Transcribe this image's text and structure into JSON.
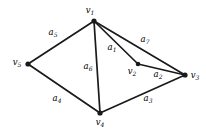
{
  "figure": {
    "kind": "undirected-graph-diagram",
    "background_color": "#ffffff",
    "stroke_color": "#1a1a1a",
    "width": 206,
    "height": 133
  },
  "vertices": [
    {
      "id": "v1",
      "label": "v",
      "subscript": "1",
      "x": 94,
      "y": 21,
      "label_x": 90,
      "label_y": 11,
      "dot_radius": 2.6
    },
    {
      "id": "v2",
      "label": "v",
      "subscript": "2",
      "x": 138,
      "y": 64,
      "label_x": 132,
      "label_y": 72,
      "dot_radius": 2.3
    },
    {
      "id": "v3",
      "label": "v",
      "subscript": "3",
      "x": 185,
      "y": 75,
      "label_x": 195,
      "label_y": 76,
      "dot_radius": 2.6
    },
    {
      "id": "v4",
      "label": "v",
      "subscript": "4",
      "x": 100,
      "y": 113,
      "label_x": 100,
      "label_y": 123,
      "dot_radius": 2.6
    },
    {
      "id": "v5",
      "label": "v",
      "subscript": "5",
      "x": 28,
      "y": 64,
      "label_x": 17,
      "label_y": 63,
      "dot_radius": 2.6
    }
  ],
  "edges": [
    {
      "id": "a1",
      "label": "a",
      "subscript": "1",
      "from": "v1",
      "to": "v2",
      "label_x": 112,
      "label_y": 48
    },
    {
      "id": "a2",
      "label": "a",
      "subscript": "2",
      "from": "v2",
      "to": "v3",
      "label_x": 158,
      "label_y": 75
    },
    {
      "id": "a3",
      "label": "a",
      "subscript": "3",
      "from": "v4",
      "to": "v3",
      "label_x": 148,
      "label_y": 99
    },
    {
      "id": "a4",
      "label": "a",
      "subscript": "4",
      "from": "v5",
      "to": "v4",
      "label_x": 57,
      "label_y": 99
    },
    {
      "id": "a5",
      "label": "a",
      "subscript": "5",
      "from": "v5",
      "to": "v1",
      "label_x": 53,
      "label_y": 33
    },
    {
      "id": "a6",
      "label": "a",
      "subscript": "6",
      "from": "v1",
      "to": "v4",
      "label_x": 88,
      "label_y": 67
    },
    {
      "id": "a7",
      "label": "a",
      "subscript": "7",
      "from": "v1",
      "to": "v3",
      "label_x": 145,
      "label_y": 40
    }
  ]
}
